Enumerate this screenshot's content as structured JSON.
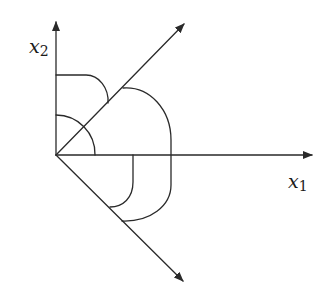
{
  "diagram": {
    "stroke_color": "#2a2a2a",
    "background": "#ffffff",
    "axes": {
      "x1": {
        "label_base": "x",
        "label_sub": "1"
      },
      "x2": {
        "label_base": "x",
        "label_sub": "2"
      }
    },
    "rays": [
      {
        "name": "upper-diagonal-ray",
        "direction": "up-right (45 deg)"
      },
      {
        "name": "lower-diagonal-ray",
        "direction": "down-right (-45 deg)"
      }
    ],
    "arcs": [
      {
        "name": "small-quarter-arc",
        "from": "x2-axis",
        "to": "x1-axis"
      },
      {
        "name": "upper-arc",
        "from": "x2-axis",
        "to": "upper-diagonal"
      },
      {
        "name": "large-arc",
        "from": "upper-diagonal",
        "to": "lower-diagonal"
      },
      {
        "name": "inner-lower-arc",
        "from": "x1-axis",
        "to": "lower-diagonal"
      }
    ]
  }
}
